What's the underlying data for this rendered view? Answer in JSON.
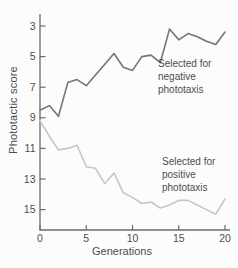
{
  "figure": {
    "background": "#fcfcfc"
  },
  "chart_data": {
    "type": "line",
    "title": "",
    "xlabel": "Generations",
    "ylabel": "Phototactic score",
    "x_ticks": [
      0,
      5,
      10,
      15,
      20
    ],
    "y_ticks": [
      3,
      5,
      7,
      9,
      11,
      13,
      15
    ],
    "xlim": [
      0,
      20.5
    ],
    "ylim": [
      2.2,
      16.3
    ],
    "y_axis_inverted": true,
    "grid": false,
    "legend_position": "inline-annotations",
    "axis_color": "#6b6b6b",
    "text_color": "#4d4d4d",
    "x": [
      0,
      1,
      2,
      3,
      4,
      5,
      6,
      7,
      8,
      9,
      10,
      11,
      12,
      13,
      14,
      15,
      16,
      17,
      18,
      19,
      20
    ],
    "series": [
      {
        "name": "negative-phototaxis",
        "label": "Selected for negative phototaxis",
        "color": "#747474",
        "values": [
          8.5,
          8.2,
          8.9,
          6.7,
          6.5,
          6.9,
          6.2,
          5.5,
          4.8,
          5.7,
          5.9,
          5.0,
          4.9,
          5.4,
          3.2,
          3.9,
          3.5,
          3.7,
          4.0,
          4.2,
          3.4
        ]
      },
      {
        "name": "positive-phototaxis",
        "label": "Selected for positive phototaxis",
        "color": "#c5c5c5",
        "values": [
          9.2,
          10.2,
          11.1,
          11.0,
          10.8,
          12.2,
          12.3,
          13.3,
          12.6,
          13.9,
          14.2,
          14.6,
          14.5,
          14.9,
          14.7,
          14.4,
          14.4,
          14.7,
          15.0,
          15.3,
          14.3
        ]
      }
    ],
    "annotations": [
      {
        "text": "Selected for\nnegative\nphototaxis",
        "series": "negative-phototaxis"
      },
      {
        "text": "Selected for\npositive\nphototaxis",
        "series": "positive-phototaxis"
      }
    ]
  }
}
